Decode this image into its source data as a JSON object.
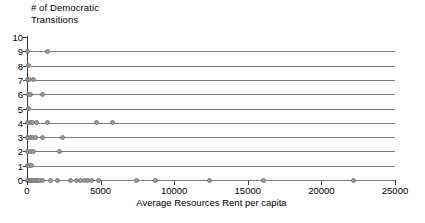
{
  "chart_data": {
    "type": "scatter",
    "title": "",
    "xlabel": "Average Resources Rent per capita",
    "ylabel": "# of Democratic Transitions",
    "ylabel_lines": [
      "# of Democratic",
      "Transitions"
    ],
    "xlim": [
      0,
      25000
    ],
    "ylim": [
      0,
      10
    ],
    "xticks": [
      0,
      5000,
      10000,
      15000,
      20000,
      25000
    ],
    "xtick_labels": [
      "0",
      "5000",
      "10000",
      "15000",
      "20000",
      "25000"
    ],
    "yticks": [
      0,
      1,
      2,
      3,
      4,
      5,
      6,
      7,
      8,
      9,
      10
    ],
    "ytick_labels": [
      "0",
      "1",
      "2",
      "3",
      "4",
      "5",
      "6",
      "7",
      "8",
      "9",
      "10"
    ],
    "grid": "horizontal",
    "legend": null,
    "marker_color": "#9a9a9a",
    "marker_edge_color": "#7c7c7c",
    "axis_color": "#3a3a3a",
    "gridline_color": "#7d7d7d",
    "background_color": "#ffffff",
    "points": [
      {
        "x": 60,
        "y": 9
      },
      {
        "x": 1400,
        "y": 9
      },
      {
        "x": 80,
        "y": 8
      },
      {
        "x": 40,
        "y": 7
      },
      {
        "x": 200,
        "y": 7
      },
      {
        "x": 420,
        "y": 7
      },
      {
        "x": 70,
        "y": 6
      },
      {
        "x": 260,
        "y": 6
      },
      {
        "x": 1080,
        "y": 6
      },
      {
        "x": 90,
        "y": 5
      },
      {
        "x": 60,
        "y": 4
      },
      {
        "x": 230,
        "y": 4
      },
      {
        "x": 400,
        "y": 4
      },
      {
        "x": 620,
        "y": 4
      },
      {
        "x": 1420,
        "y": 4
      },
      {
        "x": 4700,
        "y": 4
      },
      {
        "x": 5800,
        "y": 4
      },
      {
        "x": 50,
        "y": 3
      },
      {
        "x": 210,
        "y": 3
      },
      {
        "x": 380,
        "y": 3
      },
      {
        "x": 560,
        "y": 3
      },
      {
        "x": 1020,
        "y": 3
      },
      {
        "x": 2380,
        "y": 3
      },
      {
        "x": 60,
        "y": 2
      },
      {
        "x": 250,
        "y": 2
      },
      {
        "x": 430,
        "y": 2
      },
      {
        "x": 2180,
        "y": 2
      },
      {
        "x": 60,
        "y": 1
      },
      {
        "x": 200,
        "y": 1
      },
      {
        "x": 330,
        "y": 1
      },
      {
        "x": 40,
        "y": 0
      },
      {
        "x": 130,
        "y": 0
      },
      {
        "x": 220,
        "y": 0
      },
      {
        "x": 300,
        "y": 0
      },
      {
        "x": 380,
        "y": 0
      },
      {
        "x": 470,
        "y": 0
      },
      {
        "x": 560,
        "y": 0
      },
      {
        "x": 650,
        "y": 0
      },
      {
        "x": 760,
        "y": 0
      },
      {
        "x": 880,
        "y": 0
      },
      {
        "x": 1020,
        "y": 0
      },
      {
        "x": 1620,
        "y": 0
      },
      {
        "x": 2080,
        "y": 0
      },
      {
        "x": 2950,
        "y": 0
      },
      {
        "x": 3380,
        "y": 0
      },
      {
        "x": 3620,
        "y": 0
      },
      {
        "x": 3880,
        "y": 0
      },
      {
        "x": 4120,
        "y": 0
      },
      {
        "x": 4380,
        "y": 0
      },
      {
        "x": 4880,
        "y": 0
      },
      {
        "x": 7450,
        "y": 0
      },
      {
        "x": 8720,
        "y": 0
      },
      {
        "x": 12420,
        "y": 0
      },
      {
        "x": 16100,
        "y": 0
      },
      {
        "x": 22150,
        "y": 0
      }
    ]
  }
}
